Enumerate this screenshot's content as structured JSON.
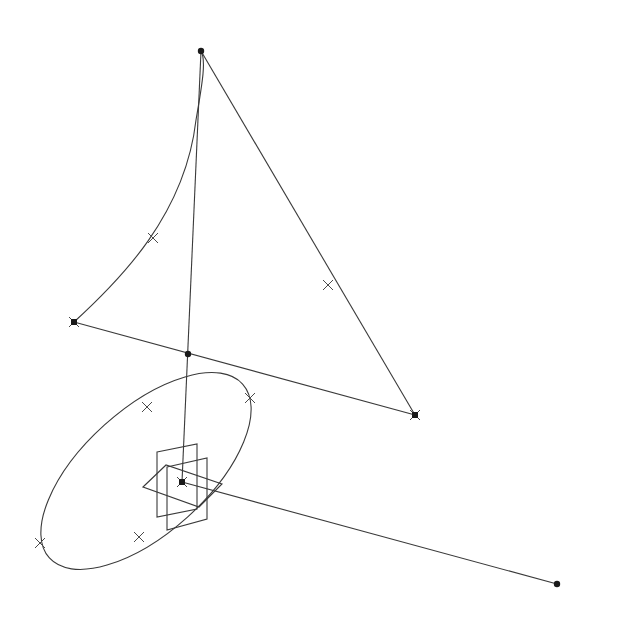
{
  "canvas": {
    "width": 622,
    "height": 621,
    "background": "#ffffff",
    "stroke": "#3a3a3a"
  },
  "points": [
    {
      "id": "apex",
      "x": 201,
      "y": 51,
      "style": "dot"
    },
    {
      "id": "left",
      "x": 74,
      "y": 322,
      "style": "square-cross"
    },
    {
      "id": "right",
      "x": 415,
      "y": 415,
      "style": "square-cross"
    },
    {
      "id": "mid",
      "x": 188,
      "y": 354,
      "style": "dot"
    },
    {
      "id": "center",
      "x": 182,
      "y": 482,
      "style": "square-cross"
    },
    {
      "id": "end",
      "x": 557,
      "y": 584,
      "style": "dot"
    }
  ],
  "lines": [
    {
      "id": "apex-right",
      "x1": 201,
      "y1": 51,
      "x2": 415,
      "y2": 415
    },
    {
      "id": "left-right",
      "x1": 74,
      "y1": 322,
      "x2": 415,
      "y2": 415
    },
    {
      "id": "apex-center",
      "x1": 201,
      "y1": 51,
      "x2": 182,
      "y2": 482
    },
    {
      "id": "center-end",
      "x1": 182,
      "y1": 482,
      "x2": 557,
      "y2": 584
    }
  ],
  "curves": [
    {
      "id": "arc-left-apex",
      "d": "M74,322 C120,280 185,215 196,120 C203,80 206,60 201,51"
    }
  ],
  "ellipse": {
    "cx": 146,
    "cy": 471,
    "rx": 130,
    "ry": 62,
    "rotate": -42
  },
  "ticks": [
    {
      "x": 153,
      "y": 238
    },
    {
      "x": 328,
      "y": 285
    },
    {
      "x": 147,
      "y": 407
    },
    {
      "x": 250,
      "y": 398
    },
    {
      "x": 40,
      "y": 543
    },
    {
      "x": 139,
      "y": 537
    }
  ],
  "planes": [
    {
      "id": "plane-vertical-a",
      "pts": "157,452 197,444 197,509 157,517"
    },
    {
      "id": "plane-vertical-b",
      "pts": "167,467 207,458 207,519 167,530"
    },
    {
      "id": "plane-horizontal",
      "pts": "143,487 166,465 222,484 199,507"
    }
  ]
}
